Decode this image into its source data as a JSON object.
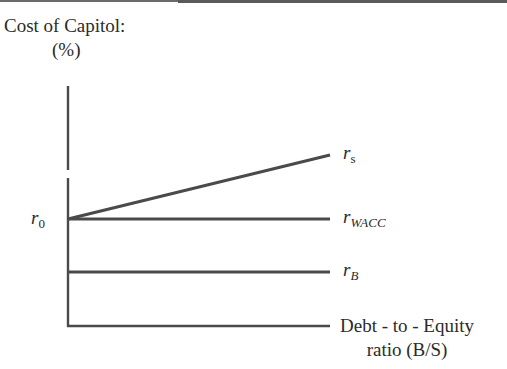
{
  "diagram": {
    "title": "Cost of Capitol:",
    "y_unit": "(%)",
    "x_label_line1": "Debt - to - Equity",
    "x_label_line2": "ratio (B/S)",
    "y_intercept_label": {
      "base": "r",
      "sub": "0"
    },
    "series": [
      {
        "name": "r_s",
        "base": "r",
        "sub": "s",
        "shape": "rising line from r0"
      },
      {
        "name": "r_WACC",
        "base": "r",
        "sub": "WACC",
        "shape": "horizontal at r0"
      },
      {
        "name": "r_B",
        "base": "r",
        "sub": "B",
        "shape": "horizontal below r0"
      }
    ],
    "colors": {
      "line": "#4a4a4a",
      "text": "#2b2b2b",
      "background": "#ffffff"
    }
  }
}
